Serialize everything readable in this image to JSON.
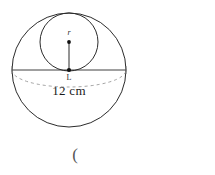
{
  "figure": {
    "type": "geometry-diagram",
    "background_color": "#ffffff",
    "stroke_color": "#2b2b2b",
    "dashed_color": "#9a9a9a",
    "text_color": "#1a1a1a",
    "outer_circle": {
      "name": "sphere-outline",
      "center_x": 69,
      "center_y": 70,
      "radius": 57
    },
    "equator_ellipse": {
      "name": "equator-dashed-arc",
      "center_x": 69,
      "center_y": 70,
      "rx": 57,
      "ry": 17,
      "dash_pattern": "3 3"
    },
    "diameter_line": {
      "name": "horizontal-diameter",
      "x1": 12,
      "y1": 70,
      "x2": 126,
      "y2": 70
    },
    "inner_circle": {
      "name": "inscribed-circle",
      "center_x": 69,
      "center_y": 42,
      "radius": 29
    },
    "radius_segment": {
      "name": "radius-line",
      "x1": 69,
      "y1": 42,
      "x2": 69,
      "y2": 70
    },
    "points": [
      {
        "name": "inner-center-point",
        "x": 69,
        "y": 42
      },
      {
        "name": "sphere-center-point",
        "x": 69,
        "y": 70
      }
    ],
    "labels": {
      "radius": "r",
      "center": "L",
      "dimension": "12 cm",
      "trailing_mark": "("
    }
  }
}
